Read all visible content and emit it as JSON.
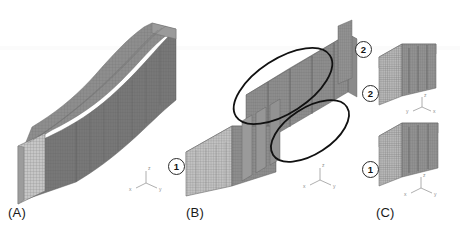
{
  "figure": {
    "background_color": "#ffffff",
    "width": 460,
    "height": 230
  },
  "panels": [
    {
      "id": "A",
      "label": "(A)",
      "description": "Full curved S-shaped tapered beam solid mesh, single continuous body",
      "mesh_color": "#7d7d7d",
      "face_color": "#c9c9c9"
    },
    {
      "id": "B",
      "label": "(B)",
      "description": "Curved S-shaped beam sliced into layered segments with two highlight ellipses",
      "mesh_color": "#8a8a8a",
      "face_color": "#c4c4c4"
    },
    {
      "id": "C",
      "label": "(C)",
      "description": "Two separated layered block sub-models extracted from the beam",
      "mesh_color": "#8a8a8a",
      "face_color": "#c4c4c4"
    }
  ],
  "callouts": [
    {
      "id": "b1",
      "text": "1",
      "panel": "B",
      "x": 168,
      "y": 158
    },
    {
      "id": "c2_left",
      "text": "2",
      "panel": "C",
      "x": 355,
      "y": 41
    },
    {
      "id": "c2_right",
      "text": "2",
      "panel": "C",
      "x": 362,
      "y": 85
    },
    {
      "id": "c1",
      "text": "1",
      "panel": "C",
      "x": 362,
      "y": 161
    }
  ],
  "annotations": {
    "ellipse_color": "#111111",
    "ellipse_stroke_width": 1.8,
    "ellipses": [
      {
        "id": "upper-highlight",
        "cx": 283,
        "cy": 86,
        "rx": 56,
        "ry": 27,
        "rotation": -33
      },
      {
        "id": "lower-highlight",
        "cx": 310,
        "cy": 131,
        "rx": 44,
        "ry": 23,
        "rotation": -33
      }
    ]
  },
  "axis_triads": [
    {
      "id": "triad-a",
      "x": 146,
      "y": 183,
      "z_label": "z",
      "x_label": "x",
      "y_label": "y",
      "layout": "x-left-y-right"
    },
    {
      "id": "triad-b",
      "x": 320,
      "y": 180,
      "z_label": "z",
      "x_label": "x",
      "y_label": "y",
      "layout": "x-left-y-right"
    },
    {
      "id": "triad-c-upper",
      "x": 422,
      "y": 107,
      "z_label": "z",
      "x_label": "x",
      "y_label": "y",
      "layout": "y-left-x-right"
    },
    {
      "id": "triad-c-lower",
      "x": 421,
      "y": 188,
      "z_label": "z",
      "x_label": "x",
      "y_label": "y",
      "layout": "x-left-y-right"
    }
  ],
  "panel_label_positions": [
    {
      "id": "label-a",
      "text_key": 0,
      "x": 8,
      "y": 207
    },
    {
      "id": "label-b",
      "text_key": 1,
      "x": 186,
      "y": 207
    },
    {
      "id": "label-c",
      "text_key": 2,
      "x": 376,
      "y": 207
    }
  ],
  "panel_labels": {
    "a": "(A)",
    "b": "(B)",
    "c": "(C)"
  }
}
